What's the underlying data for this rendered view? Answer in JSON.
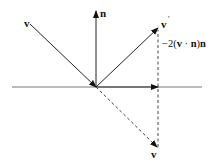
{
  "diagram": {
    "labels": {
      "incident": "v",
      "normal": "n",
      "reflected": "v",
      "reflected_prime": "'",
      "projection_prefix": "−2(",
      "projection_v": "v",
      "projection_dot": " · ",
      "projection_n": "n",
      "projection_close": ")",
      "projection_n2": "n",
      "mirrored_incident": "v"
    },
    "colors": {
      "line": "#222222",
      "surface": "#666666",
      "dashed": "#444444"
    }
  }
}
